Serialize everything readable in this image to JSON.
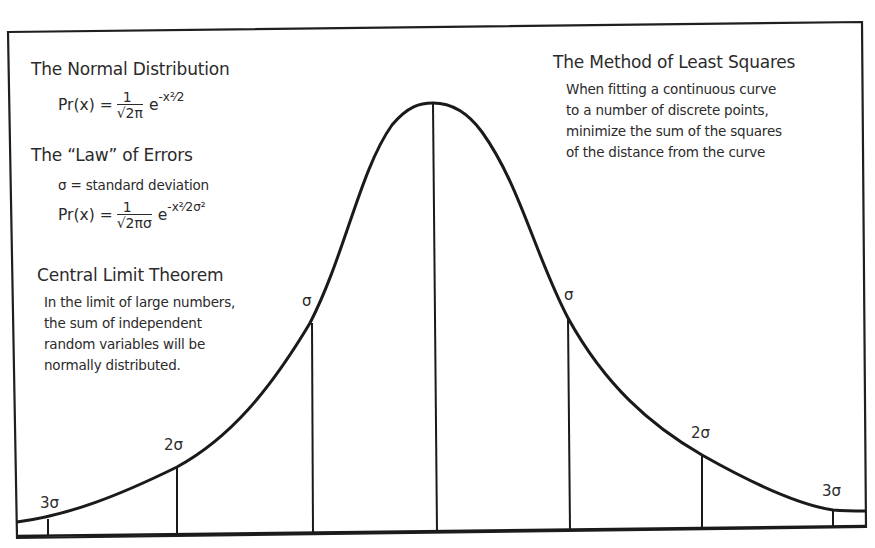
{
  "left_panel": {
    "normal_distribution": {
      "title": "The Normal Distribution",
      "formula_lhs": "Pr(x) =",
      "formula_num": "1",
      "formula_den": "√2π",
      "formula_exp_base": "e",
      "formula_exp": "-x²⁄2"
    },
    "law_of_errors": {
      "title": "The “Law” of Errors",
      "definition": "σ = standard deviation",
      "formula_lhs": "Pr(x) =",
      "formula_num": "1",
      "formula_den": "√2πσ",
      "formula_exp_base": "e",
      "formula_exp": "-x²⁄2σ²"
    },
    "central_limit": {
      "title": "Central Limit Theorem",
      "lines": [
        "In the limit of large numbers,",
        "the sum of independent",
        "random variables will be",
        "normally distributed."
      ]
    }
  },
  "right_panel": {
    "least_squares": {
      "title": "The Method of Least Squares",
      "lines": [
        "When fitting a continuous curve",
        "to a number of discrete points,",
        "minimize the sum of the squares",
        "of the distance from the curve"
      ]
    }
  },
  "curve": {
    "type": "normal-distribution-bell-curve",
    "line_color": "#1a1a1a",
    "markers": [
      {
        "label": "3σ",
        "side": "left"
      },
      {
        "label": "2σ",
        "side": "left"
      },
      {
        "label": "σ",
        "side": "left"
      },
      {
        "label": "",
        "side": "center"
      },
      {
        "label": "σ",
        "side": "right"
      },
      {
        "label": "2σ",
        "side": "right"
      },
      {
        "label": "3σ",
        "side": "right"
      }
    ]
  }
}
